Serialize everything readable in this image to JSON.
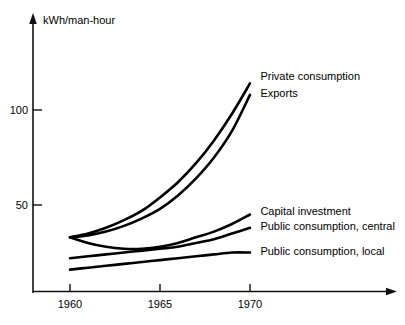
{
  "chart_data": {
    "type": "line",
    "title": "",
    "subtitle": "",
    "xlabel": "",
    "ylabel": "kWh/man-hour",
    "ylabel_position": "top-of-axis",
    "x_tick_labels": [
      "1960",
      "1965",
      "1970"
    ],
    "x_ticks": [
      1960,
      1965,
      1970
    ],
    "y_tick_labels": [
      "50",
      "100"
    ],
    "y_ticks": [
      50,
      100
    ],
    "xlim": [
      1959.2,
      1972.5
    ],
    "ylim": [
      0,
      125
    ],
    "grid": false,
    "legend": "inline-right-end-labels",
    "x": [
      1960,
      1961,
      1962,
      1963,
      1964,
      1965,
      1966,
      1967,
      1968,
      1969,
      1970
    ],
    "series": [
      {
        "name": "Private consumption",
        "label": "Private consumption",
        "values": [
          33,
          35,
          38,
          42,
          47,
          54,
          62,
          72,
          84,
          98,
          114
        ],
        "label_x": 1970.3,
        "label_y": 118
      },
      {
        "name": "Exports",
        "label": "Exports",
        "values": [
          33,
          34,
          36,
          39,
          43,
          48,
          55,
          64,
          75,
          89,
          108
        ],
        "label_x": 1970.3,
        "label_y": 109
      },
      {
        "name": "Capital investment",
        "label": "Capital investment",
        "values": [
          33,
          30,
          28,
          27,
          27,
          28,
          30,
          33,
          36,
          40,
          45
        ],
        "label_x": 1970.3,
        "label_y": 47
      },
      {
        "name": "Public consumption, central",
        "label": "Public consumption, central",
        "values": [
          22,
          23,
          24,
          25,
          26,
          27,
          28,
          30,
          32,
          35,
          38
        ],
        "label_x": 1970.3,
        "label_y": 39
      },
      {
        "name": "Public consumption, local",
        "label": "Public consumption, local",
        "values": [
          16,
          17,
          18,
          19,
          20,
          21,
          22,
          23,
          24,
          25,
          25
        ],
        "label_x": 1970.3,
        "label_y": 26
      }
    ]
  },
  "axes": {
    "y_axis_name": "vertical-value-axis",
    "x_axis_name": "horizontal-year-axis"
  }
}
